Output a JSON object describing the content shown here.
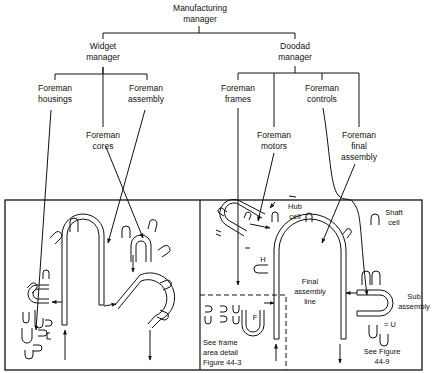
{
  "org_chart": {
    "top": {
      "line1": "Manufacturing",
      "line2": "manager"
    },
    "widget_manager": {
      "line1": "Widget",
      "line2": "manager"
    },
    "doodad_manager": {
      "line1": "Doodad",
      "line2": "manager"
    },
    "foremen": {
      "housings": {
        "line1": "Foreman",
        "line2": "housings"
      },
      "cores": {
        "line1": "Foreman",
        "line2": "cores"
      },
      "assembly": {
        "line1": "Foreman",
        "line2": "assembly"
      },
      "frames": {
        "line1": "Foreman",
        "line2": "frames"
      },
      "motors": {
        "line1": "Foreman",
        "line2": "motors"
      },
      "controls": {
        "line1": "Foreman",
        "line2": "controls"
      },
      "final_assembly": {
        "line1": "Foreman",
        "line2": "final",
        "line3": "assembly"
      }
    }
  },
  "layout": {
    "hub_cell": {
      "line1": "Hub",
      "line2": "cell"
    },
    "shaft_cell": {
      "line1": "Shaft",
      "line2": "cell"
    },
    "h_label": "H",
    "f_label": "F",
    "final_line": {
      "line1": "Final",
      "line2": "assembly",
      "line3": "line"
    },
    "sub_assembly": {
      "line1": "Sub",
      "line2": "assembly"
    },
    "equals_u": "= U",
    "frame_note": {
      "line1": "See frame",
      "line2": "area detail",
      "line3": "Figure 44-3"
    },
    "figure_note": {
      "line1": "See Figure",
      "line2": "44-9"
    }
  }
}
